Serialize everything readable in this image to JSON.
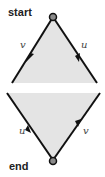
{
  "diagram": {
    "start_label": "start",
    "end_label": "end",
    "upper": {
      "left_edge_label": "v",
      "right_edge_label": "u"
    },
    "lower": {
      "left_edge_label": "u",
      "right_edge_label": "v"
    },
    "colors": {
      "fill": "#e4e4e4",
      "stroke": "#111111",
      "node": "#8a8a8a"
    }
  }
}
